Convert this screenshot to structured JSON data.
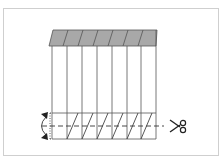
{
  "diagram": {
    "panel_count": 7,
    "colors": {
      "frame": "#cfcfcf",
      "line": "#4a4a4a",
      "header_fill": "#a8a8a8",
      "header_stroke": "#555555",
      "panel_fill": "#ffffff",
      "dashed_line": "#333333",
      "arrow": "#222222"
    },
    "icons": {
      "cut": "scissors-icon",
      "fold": "curved-double-arrow-icon"
    },
    "symbols": {
      "scissors": "✂"
    }
  }
}
